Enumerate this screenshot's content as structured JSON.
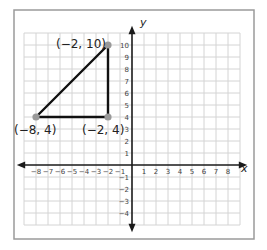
{
  "chart_data": {
    "type": "scatter",
    "title": "",
    "xlabel": "x",
    "ylabel": "y",
    "xlim": [
      -8,
      8
    ],
    "ylim": [
      -4,
      10
    ],
    "grid": true,
    "x_ticks": [
      -8,
      -7,
      -6,
      -5,
      -4,
      -3,
      -2,
      -1,
      1,
      2,
      3,
      4,
      5,
      6,
      7,
      8
    ],
    "y_ticks": [
      -4,
      -3,
      -2,
      -1,
      1,
      2,
      3,
      4,
      5,
      6,
      7,
      8,
      9,
      10
    ],
    "points": [
      {
        "x": -2,
        "y": 10,
        "label": "(−2, 10)"
      },
      {
        "x": -8,
        "y": 4,
        "label": "(−8, 4)"
      },
      {
        "x": -2,
        "y": 4,
        "label": "(−2, 4)"
      }
    ],
    "polygon": [
      [
        -2,
        10
      ],
      [
        -8,
        4
      ],
      [
        -2,
        4
      ]
    ],
    "shape": "right triangle"
  },
  "labels": {
    "axis_x": "x",
    "axis_y": "y",
    "point_a": "(−2, 10)",
    "point_b": "(−8, 4)",
    "point_c": "(−2, 4)"
  },
  "colors": {
    "grid": "#d4d4d4",
    "axis": "#1a1a1a",
    "frame": "#9a9a9a",
    "triangle": "#111111",
    "point": "#999999"
  }
}
